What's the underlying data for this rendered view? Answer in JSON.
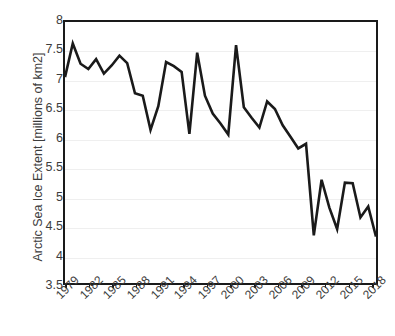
{
  "chart_data": {
    "type": "line",
    "title": "",
    "xlabel": "",
    "ylabel": "Arctic Sea Ice Extent [millions of km2]",
    "ylim": [
      3.5,
      8
    ],
    "xlim": [
      1979,
      2019
    ],
    "yticks": [
      3.5,
      4,
      4.5,
      5,
      5.5,
      6,
      6.5,
      7,
      7.5,
      8
    ],
    "ytick_labels": [
      "3.5",
      "4",
      "4.5",
      "5",
      "5.5",
      "6",
      "6.5",
      "7",
      "7.5",
      "8"
    ],
    "xtick_labels": [
      "1979",
      "1982",
      "1985",
      "1988",
      "1991",
      "1994",
      "1997",
      "2000",
      "2003",
      "2006",
      "2009",
      "2012",
      "2015",
      "2018"
    ],
    "xticks": [
      1979,
      1982,
      1985,
      1988,
      1991,
      1994,
      1997,
      2000,
      2003,
      2006,
      2009,
      2012,
      2015,
      2018
    ],
    "grid": "horizontal",
    "legend": "none",
    "line_color": "#1a1a1a",
    "line_width": 2.6,
    "x": [
      1979,
      1980,
      1981,
      1982,
      1983,
      1984,
      1985,
      1986,
      1987,
      1988,
      1989,
      1990,
      1991,
      1992,
      1993,
      1994,
      1995,
      1996,
      1997,
      1998,
      1999,
      2000,
      2001,
      2002,
      2003,
      2004,
      2005,
      2006,
      2007,
      2008,
      2009,
      2010,
      2011,
      2012,
      2013,
      2014,
      2015,
      2016,
      2017,
      2018,
      2019
    ],
    "values": [
      7.05,
      7.63,
      7.28,
      7.19,
      7.36,
      7.11,
      7.25,
      7.42,
      7.29,
      6.77,
      6.73,
      6.14,
      6.55,
      7.31,
      7.24,
      7.14,
      6.07,
      7.47,
      6.73,
      6.42,
      6.25,
      6.06,
      7.6,
      6.53,
      6.35,
      6.18,
      6.63,
      6.5,
      6.22,
      6.02,
      5.82,
      5.9,
      4.32,
      5.28,
      4.8,
      4.43,
      5.23,
      5.22,
      4.63,
      4.82,
      4.3
    ],
    "series_name": "Arctic Sea Ice Extent"
  }
}
